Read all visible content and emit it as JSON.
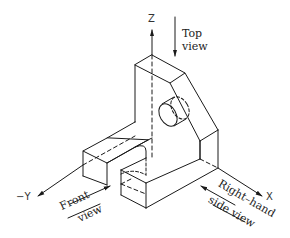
{
  "diagram": {
    "type": "isometric-projection",
    "axes": {
      "z_label": "Z",
      "x_label": "X",
      "neg_y_label": "−Y"
    },
    "view_labels": {
      "top_line1": "Top",
      "top_line2": "view",
      "front_line1": "Front",
      "front_line2": "view",
      "right_line1": "Right–hand",
      "right_line2": "side view"
    },
    "colors": {
      "line": "#1a1a1a",
      "background": "#ffffff"
    }
  }
}
